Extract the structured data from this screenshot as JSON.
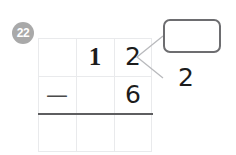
{
  "problem": {
    "number_label": "22",
    "badge_color": "#a9a9a9",
    "operation": "subtraction",
    "expression": "12 - 6"
  },
  "grid": {
    "columns": 3,
    "rows": 3,
    "gridline_color": "#e9eaec",
    "answer_rule_color": "#5e5e60",
    "rows_data": [
      {
        "name": "minuend-row",
        "cells": [
          "",
          "1",
          "2"
        ]
      },
      {
        "name": "subtrahend-row",
        "cells": [
          "—",
          "",
          "6"
        ]
      },
      {
        "name": "difference-row",
        "cells": [
          "",
          "",
          ""
        ]
      }
    ]
  },
  "callout": {
    "box_value": "",
    "box_border_color": "#6d6d70",
    "annotation_value": "2",
    "line_color": "#b9babd"
  }
}
